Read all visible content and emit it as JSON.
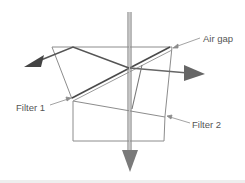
{
  "diagram": {
    "type": "optical beam splitter / dichroic filter schematic",
    "labels": {
      "air_gap": "Air gap",
      "filter_1": "Filter 1",
      "filter_2": "Filter 2"
    },
    "colors": {
      "beam_dark": "#555555",
      "beam_vertical": "#8a8a8a",
      "outline": "#8c8c8c",
      "filter_dark": "#4a4a4a",
      "label_text": "#555555",
      "background": "#ffffff"
    },
    "beams": [
      {
        "name": "incoming-beam",
        "direction": "down"
      },
      {
        "name": "reflected-beam-left",
        "direction": "left"
      },
      {
        "name": "reflected-beam-right",
        "direction": "right"
      },
      {
        "name": "transmitted-beam",
        "direction": "down"
      }
    ]
  }
}
